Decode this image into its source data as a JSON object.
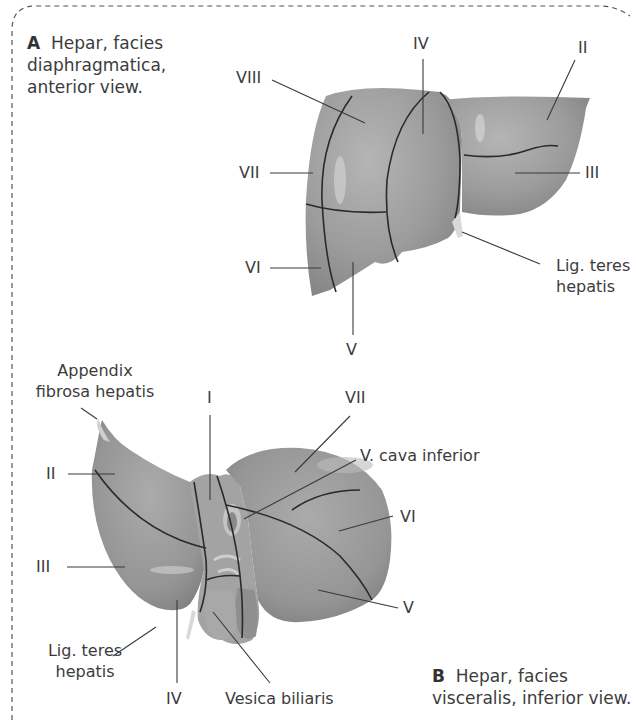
{
  "figure_a": {
    "letter": "A",
    "caption": "Hepar, facies diaphragmatica, anterior view.",
    "caption_lines": [
      "Hepar, facies",
      "diaphragmatica,",
      "anterior view."
    ],
    "labels": {
      "viii": "VIII",
      "iv": "IV",
      "ii": "II",
      "vii": "VII",
      "iii": "III",
      "vi": "VI",
      "v": "V",
      "lig_teres_1": "Lig. teres",
      "lig_teres_2": "hepatis"
    }
  },
  "figure_b": {
    "letter": "B",
    "caption": "Hepar, facies visceralis, inferior view.",
    "caption_lines": [
      "Hepar, facies",
      "visceralis, inferior view."
    ],
    "labels": {
      "appendix_1": "Appendix",
      "appendix_2": "fibrosa hepatis",
      "i": "I",
      "vii": "VII",
      "vena_cava": "V. cava inferior",
      "ii": "II",
      "vi": "VI",
      "iii": "III",
      "v": "V",
      "lig_teres_1": "Lig. teres",
      "lig_teres_2": "hepatis",
      "iv": "IV",
      "vesica": "Vesica biliaris"
    }
  },
  "colors": {
    "liver_fill": "#9a9a9a",
    "liver_light": "#b8b8b8",
    "segment_line": "#2a2a2a",
    "leader_line": "#3a3a3a",
    "border_dash": "#555555",
    "text": "#3c3c3c"
  }
}
